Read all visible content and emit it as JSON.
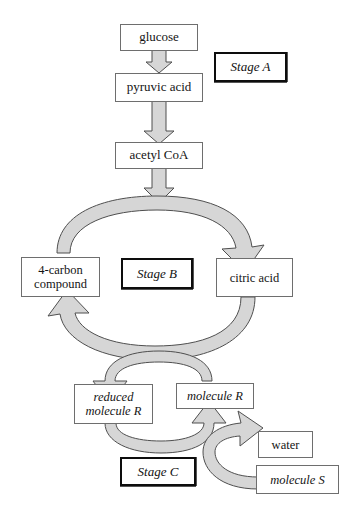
{
  "diagram": {
    "colors": {
      "arrow_fill": "#d6d6d6",
      "arrow_stroke": "#4f4f4f",
      "box_border": "#6e6e6e",
      "stage_border": "#0d0d0d",
      "text": "#141414",
      "background": "#ffffff"
    },
    "nodes": [
      {
        "id": "glucose",
        "label": "glucose",
        "italic": false
      },
      {
        "id": "pyruvic_acid",
        "label": "pyruvic acid",
        "italic": false
      },
      {
        "id": "acetyl_coa",
        "label": "acetyl CoA",
        "italic": false
      },
      {
        "id": "four_carbon",
        "label_line1": "4-carbon",
        "label_line2": "compound",
        "italic": false
      },
      {
        "id": "citric_acid",
        "label": "citric acid",
        "italic": false
      },
      {
        "id": "reduced_mol_r",
        "label_line1": "reduced",
        "label_line2": "molecule R",
        "italic": true
      },
      {
        "id": "molecule_r",
        "label": "molecule R",
        "italic": true
      },
      {
        "id": "water",
        "label": "water",
        "italic": false
      },
      {
        "id": "molecule_s",
        "label": "molecule S",
        "italic": true
      }
    ],
    "stages": [
      {
        "id": "stage_a",
        "label": "Stage A"
      },
      {
        "id": "stage_b",
        "label": "Stage B"
      },
      {
        "id": "stage_c",
        "label": "Stage C"
      }
    ],
    "node_labels": {
      "glucose": "glucose",
      "pyruvic_acid": "pyruvic acid",
      "acetyl_coa": "acetyl CoA",
      "four_carbon_line1": "4-carbon",
      "four_carbon_line2": "compound",
      "citric_acid": "citric acid",
      "reduced_line1": "reduced",
      "reduced_line2": "molecule R",
      "molecule_r": "molecule R",
      "water": "water",
      "molecule_s": "molecule S"
    },
    "stage_labels": {
      "stage_a": "Stage A",
      "stage_b": "Stage B",
      "stage_c": "Stage C"
    },
    "arrows": [
      {
        "id": "glucose-to-pyruvic",
        "from": "glucose",
        "to": "pyruvic_acid",
        "shape": "straight-down"
      },
      {
        "id": "pyruvic-to-acetyl",
        "from": "pyruvic_acid",
        "to": "acetyl_coa",
        "shape": "straight-down"
      },
      {
        "id": "acetyl-into-cycle",
        "from": "acetyl_coa",
        "to": "cycle",
        "shape": "straight-down"
      },
      {
        "id": "fourcarbon-to-citric",
        "from": "four_carbon",
        "to": "citric_acid",
        "shape": "arc-over-top"
      },
      {
        "id": "citric-to-fourcarbon",
        "from": "citric_acid",
        "to": "four_carbon",
        "shape": "arc-under-bottom"
      },
      {
        "id": "moleculer-to-reduced",
        "from": "molecule_r",
        "to": "reduced_mol_r",
        "shape": "arc-over-top"
      },
      {
        "id": "reduced-to-moleculer",
        "from": "reduced_mol_r",
        "to": "molecule_r",
        "shape": "arc-under-bottom"
      },
      {
        "id": "moleculeS-to-water",
        "from": "molecule_s",
        "to": "water",
        "shape": "c-curve"
      }
    ]
  }
}
